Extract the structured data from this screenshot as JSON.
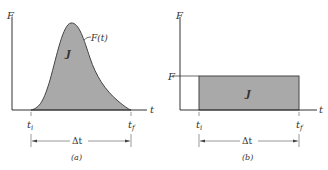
{
  "figure": {
    "panels": [
      {
        "id": "a",
        "caption": "(a)",
        "y_axis_label": "F",
        "x_axis_label": "t",
        "curve_label": "F(t)",
        "area_label": "J",
        "t_start_label": "ti",
        "t_end_label": "tf",
        "t_start_main": "t",
        "t_start_sub": "i",
        "t_end_main": "t",
        "t_end_sub": "f",
        "interval_label": "Δt"
      },
      {
        "id": "b",
        "caption": "(b)",
        "y_axis_label": "F",
        "level_label": "F",
        "x_axis_label": "t",
        "area_label": "J",
        "t_start_main": "t",
        "t_start_sub": "i",
        "t_end_main": "t",
        "t_end_sub": "f",
        "interval_label": "Δt"
      }
    ],
    "colors": {
      "fill": "#a9a9a9",
      "stroke": "#333333",
      "background": "#ffffff"
    }
  }
}
